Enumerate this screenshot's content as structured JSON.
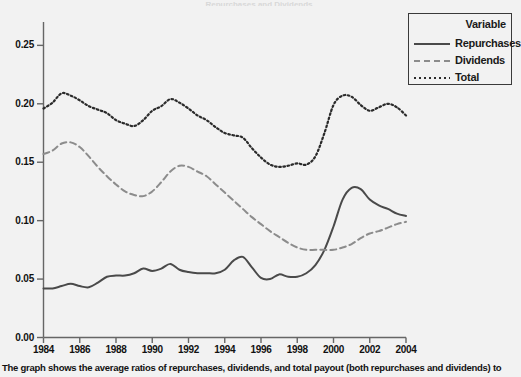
{
  "figure": {
    "cut_title": "Repurchases and Dividends",
    "caption": "The graph shows the average ratios of repurchases, dividends, and total payout (both repurchases and dividends) to"
  },
  "legend": {
    "title": "Variable",
    "entries": [
      {
        "label": "Repurchases",
        "style": "solid",
        "color": "#4a4a4a"
      },
      {
        "label": "Dividends",
        "style": "dashed",
        "color": "#8c8c8c"
      },
      {
        "label": "Total",
        "style": "dotted",
        "color": "#2b2b2b"
      }
    ]
  },
  "axes": {
    "y_ticks": [
      "0.00",
      "0.05",
      "0.10",
      "0.15",
      "0.20",
      "0.25"
    ],
    "x_ticks": [
      "1984",
      "1986",
      "1988",
      "1990",
      "1992",
      "1994",
      "1996",
      "1998",
      "2000",
      "2002",
      "2004"
    ]
  },
  "chart_data": {
    "type": "line",
    "title": "",
    "subtitle": "",
    "xlabel": "",
    "ylabel": "",
    "xlim": [
      1984,
      2004
    ],
    "ylim": [
      0.0,
      0.27
    ],
    "grid": false,
    "legend_position": "top-right",
    "legend_title": "Variable",
    "x": [
      1984,
      1984.5,
      1985,
      1985.5,
      1986,
      1986.5,
      1987,
      1987.5,
      1988,
      1988.5,
      1989,
      1989.5,
      1990,
      1990.5,
      1991,
      1991.5,
      1992,
      1992.5,
      1993,
      1993.5,
      1994,
      1994.5,
      1995,
      1995.5,
      1996,
      1996.5,
      1997,
      1997.5,
      1998,
      1998.5,
      1999,
      1999.5,
      2000,
      2000.5,
      2001,
      2001.5,
      2002,
      2002.5,
      2003,
      2003.5,
      2004
    ],
    "series": [
      {
        "name": "Repurchases",
        "style": "solid",
        "color": "#4a4a4a",
        "values": [
          0.042,
          0.042,
          0.044,
          0.046,
          0.044,
          0.043,
          0.047,
          0.052,
          0.053,
          0.053,
          0.055,
          0.059,
          0.057,
          0.059,
          0.063,
          0.058,
          0.056,
          0.055,
          0.055,
          0.055,
          0.058,
          0.066,
          0.069,
          0.06,
          0.051,
          0.05,
          0.054,
          0.052,
          0.052,
          0.055,
          0.062,
          0.075,
          0.095,
          0.118,
          0.128,
          0.127,
          0.118,
          0.113,
          0.11,
          0.106,
          0.104
        ]
      },
      {
        "name": "Dividends",
        "style": "dashed",
        "color": "#8c8c8c",
        "values": [
          0.157,
          0.16,
          0.166,
          0.167,
          0.163,
          0.155,
          0.146,
          0.138,
          0.131,
          0.125,
          0.122,
          0.121,
          0.125,
          0.133,
          0.142,
          0.147,
          0.146,
          0.142,
          0.138,
          0.131,
          0.124,
          0.117,
          0.11,
          0.103,
          0.097,
          0.091,
          0.086,
          0.081,
          0.077,
          0.075,
          0.075,
          0.075,
          0.075,
          0.077,
          0.08,
          0.085,
          0.089,
          0.091,
          0.094,
          0.097,
          0.099
        ]
      },
      {
        "name": "Total",
        "style": "dotted",
        "color": "#2b2b2b",
        "values": [
          0.196,
          0.201,
          0.209,
          0.207,
          0.203,
          0.198,
          0.195,
          0.192,
          0.186,
          0.183,
          0.181,
          0.186,
          0.194,
          0.198,
          0.204,
          0.201,
          0.196,
          0.19,
          0.186,
          0.18,
          0.175,
          0.173,
          0.171,
          0.162,
          0.154,
          0.148,
          0.146,
          0.147,
          0.149,
          0.148,
          0.155,
          0.175,
          0.199,
          0.207,
          0.206,
          0.199,
          0.194,
          0.197,
          0.2,
          0.197,
          0.19
        ]
      }
    ]
  }
}
